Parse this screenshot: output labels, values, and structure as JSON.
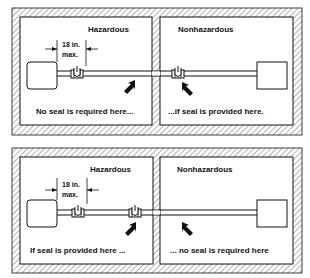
{
  "panels": [
    {
      "hazardous_label": "Hazardous",
      "nonhazardous_label": "Nonhazardous",
      "dimension_line1": "18 in.",
      "dimension_line2": "max.",
      "left_caption": "No seal is required here...",
      "right_caption": "...if seal is provided here."
    },
    {
      "hazardous_label": "Hazardous",
      "nonhazardous_label": "Nonhazardous",
      "dimension_line1": "18 in.",
      "dimension_line2": "max.",
      "left_caption": "If seal is provided here ...",
      "right_caption": "... no seal is required here"
    }
  ],
  "colors": {
    "line": "#111111",
    "hatch": "#555555",
    "background": "#ffffff"
  }
}
